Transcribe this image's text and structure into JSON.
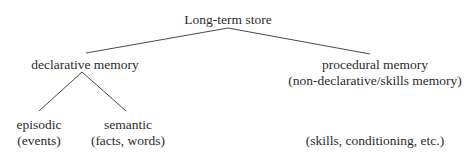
{
  "diagram": {
    "root": {
      "label": "Long-term store"
    },
    "declarative": {
      "label": "declarative memory",
      "children": [
        {
          "label": "episodic",
          "sublabel": "(events)"
        },
        {
          "label": "semantic",
          "sublabel": "(facts, words)"
        }
      ]
    },
    "procedural": {
      "label": "procedural memory",
      "sublabel": "(non-declarative/skills memory)",
      "children": [
        {
          "label": "(skills, conditioning, etc.)"
        }
      ]
    }
  },
  "colors": {
    "line": "#4a4a4a",
    "text": "#2b2b2b",
    "background": "#ffffff"
  }
}
